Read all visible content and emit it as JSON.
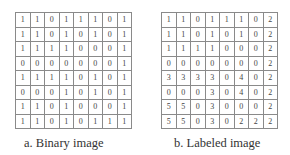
{
  "panels": [
    {
      "caption": "a. Binary image",
      "grid": [
        [
          1,
          1,
          0,
          1,
          1,
          1,
          0,
          1
        ],
        [
          1,
          1,
          0,
          1,
          0,
          1,
          0,
          1
        ],
        [
          1,
          1,
          1,
          1,
          0,
          0,
          0,
          1
        ],
        [
          0,
          0,
          0,
          0,
          0,
          0,
          0,
          1
        ],
        [
          1,
          1,
          1,
          1,
          0,
          1,
          0,
          1
        ],
        [
          0,
          0,
          0,
          1,
          0,
          1,
          0,
          1
        ],
        [
          1,
          1,
          0,
          1,
          0,
          0,
          0,
          1
        ],
        [
          1,
          1,
          0,
          1,
          0,
          1,
          1,
          1
        ]
      ]
    },
    {
      "caption": "b. Labeled image",
      "grid": [
        [
          1,
          1,
          0,
          1,
          1,
          1,
          0,
          2
        ],
        [
          1,
          1,
          0,
          1,
          0,
          1,
          0,
          2
        ],
        [
          1,
          1,
          1,
          1,
          0,
          0,
          0,
          2
        ],
        [
          0,
          0,
          0,
          0,
          0,
          0,
          0,
          2
        ],
        [
          3,
          3,
          3,
          3,
          0,
          4,
          0,
          2
        ],
        [
          0,
          0,
          0,
          3,
          0,
          4,
          0,
          2
        ],
        [
          5,
          5,
          0,
          3,
          0,
          0,
          0,
          2
        ],
        [
          5,
          5,
          0,
          3,
          0,
          2,
          2,
          2
        ]
      ]
    }
  ]
}
